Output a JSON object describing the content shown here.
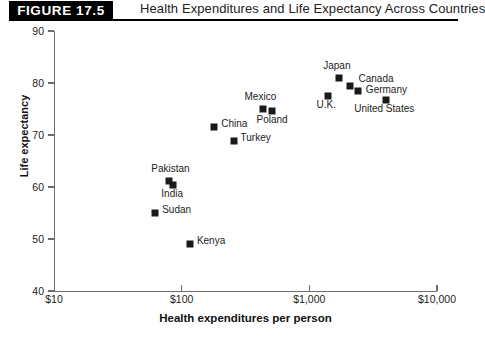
{
  "header": {
    "badge": "FIGURE 17.5",
    "title": "Health Expenditures and Life Expectancy Across Countries"
  },
  "chart_data": {
    "type": "scatter",
    "title": "Health Expenditures and Life Expectancy Across Countries",
    "xlabel": "Health expenditures per person",
    "ylabel": "Life expectancy",
    "x_scale": "log",
    "xlim": [
      10,
      10000
    ],
    "ylim": [
      40,
      90
    ],
    "xtick_labels": [
      "$10",
      "$100",
      "$1,000",
      "$10,000"
    ],
    "xtick_values": [
      10,
      100,
      1000,
      10000
    ],
    "ytick_labels": [
      "40",
      "50",
      "60",
      "70",
      "80",
      "90"
    ],
    "ytick_values": [
      40,
      50,
      60,
      70,
      80,
      90
    ],
    "grid": false,
    "legend": "none",
    "marker_color": "#1a1a1a",
    "points": [
      {
        "name": "Japan",
        "x": 1700,
        "y": 81.0,
        "label_dx": -2,
        "label_dy": -13,
        "label_align": "center"
      },
      {
        "name": "Canada",
        "x": 2100,
        "y": 79.5,
        "label_dx": 8,
        "label_dy": -8,
        "label_align": "left"
      },
      {
        "name": "Germany",
        "x": 2400,
        "y": 78.5,
        "label_dx": 8,
        "label_dy": -2,
        "label_align": "left"
      },
      {
        "name": "U.K.",
        "x": 1400,
        "y": 77.5,
        "label_dx": -2,
        "label_dy": 8,
        "label_align": "center"
      },
      {
        "name": "United States",
        "x": 4000,
        "y": 76.8,
        "label_dx": -2,
        "label_dy": 8,
        "label_align": "center"
      },
      {
        "name": "Mexico",
        "x": 430,
        "y": 75.0,
        "label_dx": -2,
        "label_dy": -13,
        "label_align": "center"
      },
      {
        "name": "Poland",
        "x": 510,
        "y": 74.6,
        "label_dx": 0,
        "label_dy": 8,
        "label_align": "center"
      },
      {
        "name": "China",
        "x": 180,
        "y": 71.5,
        "label_dx": 7,
        "label_dy": -4,
        "label_align": "left"
      },
      {
        "name": "Turkey",
        "x": 255,
        "y": 68.8,
        "label_dx": 7,
        "label_dy": -4,
        "label_align": "left"
      },
      {
        "name": "Pakistan",
        "x": 80,
        "y": 61.2,
        "label_dx": 1,
        "label_dy": -13,
        "label_align": "center"
      },
      {
        "name": "India",
        "x": 86,
        "y": 60.3,
        "label_dx": -1,
        "label_dy": 8,
        "label_align": "center"
      },
      {
        "name": "Sudan",
        "x": 62,
        "y": 55.0,
        "label_dx": 7,
        "label_dy": -4,
        "label_align": "left"
      },
      {
        "name": "Kenya",
        "x": 116,
        "y": 49.0,
        "label_dx": 7,
        "label_dy": -4,
        "label_align": "left"
      }
    ]
  }
}
